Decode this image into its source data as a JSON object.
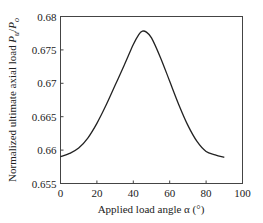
{
  "chart_data": {
    "type": "line",
    "title": "",
    "xlabel": "Applied load angle α (°)",
    "ylabel": "Normalized ultimate axial load P_u/P_o",
    "ylabel_main": "Normalized ultimate axial load ",
    "ylabel_var": "P",
    "ylabel_sub1": "u",
    "ylabel_slash": "/",
    "ylabel_var2": "P",
    "ylabel_sub2": "o",
    "xlim": [
      0,
      100
    ],
    "ylim": [
      0.655,
      0.68
    ],
    "xticks": [
      "0",
      "20",
      "40",
      "60",
      "80",
      "100"
    ],
    "yticks": [
      "0.655",
      "0.66",
      "0.665",
      "0.67",
      "0.675",
      "0.68"
    ],
    "grid": false,
    "legend": null,
    "series": [
      {
        "name": "Normalized ultimate axial load",
        "x": [
          0,
          5,
          10,
          15,
          20,
          25,
          30,
          35,
          40,
          43,
          45,
          47,
          50,
          55,
          60,
          65,
          70,
          75,
          80,
          85,
          90
        ],
        "values": [
          0.659,
          0.6595,
          0.6603,
          0.6618,
          0.664,
          0.6667,
          0.6697,
          0.6727,
          0.6758,
          0.6773,
          0.6778,
          0.6777,
          0.6768,
          0.6738,
          0.6703,
          0.6668,
          0.6637,
          0.6613,
          0.6598,
          0.6593,
          0.6589
        ]
      }
    ]
  }
}
